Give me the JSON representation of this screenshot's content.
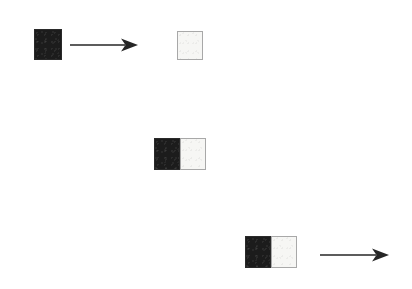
{
  "figure": {
    "background_color": "#ffffff",
    "width": 412,
    "height": 289,
    "colors": {
      "black_cell": "#1c1c1c",
      "black_cell_border": "#2a2a2a",
      "white_cell": "#f6f6f4",
      "white_cell_border": "#a8a8a8",
      "arrow": "#262626"
    },
    "rows": [
      {
        "id": "row-top",
        "label": "top-row",
        "source": {
          "id": "top-source-block",
          "cells": [
            {
              "state": "black",
              "x": 34,
              "y": 29,
              "width": 28,
              "height": 31
            }
          ]
        },
        "arrow": {
          "id": "top-arrow",
          "direction": "right",
          "x1": 70,
          "y1": 45,
          "x2": 138,
          "y2": 45
        },
        "target": {
          "id": "top-target-block",
          "cells": [
            {
              "state": "white",
              "x": 177,
              "y": 31,
              "width": 26,
              "height": 29
            }
          ]
        }
      },
      {
        "id": "row-middle",
        "label": "middle-row",
        "source": {
          "id": "middle-block",
          "cells": [
            {
              "state": "black",
              "x": 154,
              "y": 138,
              "width": 26,
              "height": 32
            },
            {
              "state": "white",
              "x": 180,
              "y": 138,
              "width": 26,
              "height": 32
            }
          ]
        },
        "arrow": null,
        "target": null
      },
      {
        "id": "row-bottom",
        "label": "bottom-row",
        "source": {
          "id": "bottom-block",
          "cells": [
            {
              "state": "black",
              "x": 245,
              "y": 236,
              "width": 26,
              "height": 32
            },
            {
              "state": "white",
              "x": 271,
              "y": 236,
              "width": 26,
              "height": 32
            }
          ]
        },
        "arrow": {
          "id": "bottom-arrow",
          "direction": "right",
          "x1": 320,
          "y1": 255,
          "x2": 389,
          "y2": 255
        },
        "target": null
      }
    ]
  }
}
